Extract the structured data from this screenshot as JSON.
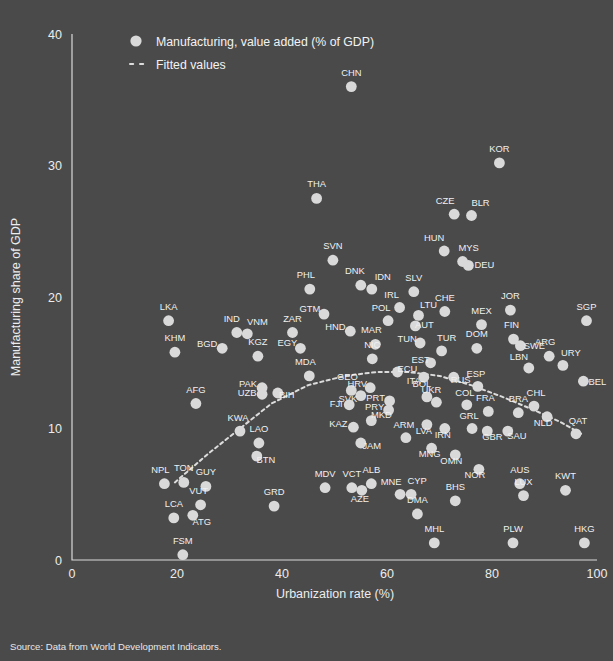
{
  "chart_data": {
    "type": "scatter",
    "title": "",
    "xlabel": "Urbanization rate (%)",
    "ylabel": "Manufacturing share of GDP",
    "xlim": [
      0,
      100
    ],
    "ylim": [
      0,
      40
    ],
    "xticks": [
      0,
      20,
      40,
      60,
      80,
      100
    ],
    "yticks": [
      0,
      10,
      20,
      30,
      40
    ],
    "grid": false,
    "legend_position": "top-left",
    "series": [
      {
        "name": "Manufacturing, value added (% of GDP)",
        "marker": "circle",
        "color": "#d9d9d9"
      },
      {
        "name": "Fitted values",
        "marker": "dashed-line",
        "color": "#dcdcdc"
      }
    ],
    "point_label_field": "iso3",
    "points": [
      {
        "iso3": "CHN",
        "x": 53.2,
        "y": 36.0
      },
      {
        "iso3": "KOR",
        "x": 81.4,
        "y": 30.2
      },
      {
        "iso3": "THA",
        "x": 46.6,
        "y": 27.5
      },
      {
        "iso3": "CZE",
        "x": 72.8,
        "y": 26.3
      },
      {
        "iso3": "BLR",
        "x": 76.1,
        "y": 26.2
      },
      {
        "iso3": "HUN",
        "x": 70.9,
        "y": 23.5
      },
      {
        "iso3": "MYS",
        "x": 74.4,
        "y": 22.7
      },
      {
        "iso3": "DEU",
        "x": 75.5,
        "y": 22.4
      },
      {
        "iso3": "SVN",
        "x": 49.7,
        "y": 22.8
      },
      {
        "iso3": "PHL",
        "x": 45.3,
        "y": 20.6
      },
      {
        "iso3": "DNK",
        "x": 55.0,
        "y": 20.9
      },
      {
        "iso3": "IDN",
        "x": 57.1,
        "y": 20.6
      },
      {
        "iso3": "SLV",
        "x": 65.1,
        "y": 20.4
      },
      {
        "iso3": "IRL",
        "x": 62.4,
        "y": 19.2
      },
      {
        "iso3": "JOR",
        "x": 83.5,
        "y": 19.0
      },
      {
        "iso3": "GTM",
        "x": 48.0,
        "y": 18.7
      },
      {
        "iso3": "LTU",
        "x": 66.0,
        "y": 18.6
      },
      {
        "iso3": "CHE",
        "x": 71.0,
        "y": 18.9
      },
      {
        "iso3": "SGP",
        "x": 98.0,
        "y": 18.2
      },
      {
        "iso3": "LKA",
        "x": 18.4,
        "y": 18.2
      },
      {
        "iso3": "POL",
        "x": 60.2,
        "y": 18.2
      },
      {
        "iso3": "AUT",
        "x": 65.4,
        "y": 17.8
      },
      {
        "iso3": "MEX",
        "x": 78.0,
        "y": 17.9
      },
      {
        "iso3": "IND",
        "x": 31.4,
        "y": 17.3
      },
      {
        "iso3": "VNM",
        "x": 33.4,
        "y": 17.2
      },
      {
        "iso3": "HND",
        "x": 53.0,
        "y": 17.4
      },
      {
        "iso3": "ZAR",
        "x": 42.0,
        "y": 17.3
      },
      {
        "iso3": "FIN",
        "x": 84.1,
        "y": 16.8
      },
      {
        "iso3": "TUN",
        "x": 66.3,
        "y": 16.5
      },
      {
        "iso3": "MAR",
        "x": 57.8,
        "y": 16.4
      },
      {
        "iso3": "EGY",
        "x": 43.5,
        "y": 16.1
      },
      {
        "iso3": "SWE",
        "x": 85.4,
        "y": 16.3
      },
      {
        "iso3": "BGD",
        "x": 28.6,
        "y": 16.1
      },
      {
        "iso3": "KHM",
        "x": 19.6,
        "y": 15.8
      },
      {
        "iso3": "KGZ",
        "x": 35.4,
        "y": 15.5
      },
      {
        "iso3": "DOM",
        "x": 77.1,
        "y": 16.1
      },
      {
        "iso3": "TUR",
        "x": 70.4,
        "y": 15.9
      },
      {
        "iso3": "ARG",
        "x": 90.9,
        "y": 15.5
      },
      {
        "iso3": "NIC",
        "x": 57.2,
        "y": 15.3
      },
      {
        "iso3": "EST",
        "x": 68.3,
        "y": 15.0
      },
      {
        "iso3": "URY",
        "x": 93.5,
        "y": 14.8
      },
      {
        "iso3": "LBN",
        "x": 87.0,
        "y": 14.6
      },
      {
        "iso3": "MDA",
        "x": 45.2,
        "y": 14.0
      },
      {
        "iso3": "ECU",
        "x": 62.0,
        "y": 14.3
      },
      {
        "iso3": "ITA",
        "x": 67.0,
        "y": 13.9
      },
      {
        "iso3": "RUS",
        "x": 72.7,
        "y": 13.9
      },
      {
        "iso3": "ESP",
        "x": 77.3,
        "y": 13.2
      },
      {
        "iso3": "BEL",
        "x": 97.4,
        "y": 13.6
      },
      {
        "iso3": "PAK",
        "x": 36.2,
        "y": 13.1
      },
      {
        "iso3": "UZB",
        "x": 36.2,
        "y": 12.6
      },
      {
        "iso3": "BIH",
        "x": 39.2,
        "y": 12.7
      },
      {
        "iso3": "GEO",
        "x": 53.2,
        "y": 12.9
      },
      {
        "iso3": "HRV",
        "x": 56.8,
        "y": 13.1
      },
      {
        "iso3": "SVK",
        "x": 55.0,
        "y": 12.5
      },
      {
        "iso3": "BOL",
        "x": 67.6,
        "y": 12.4
      },
      {
        "iso3": "UKR",
        "x": 69.4,
        "y": 12.0
      },
      {
        "iso3": "PRT",
        "x": 60.5,
        "y": 12.1
      },
      {
        "iso3": "CHL",
        "x": 88.0,
        "y": 11.7
      },
      {
        "iso3": "AFG",
        "x": 23.6,
        "y": 11.9
      },
      {
        "iso3": "FJI",
        "x": 52.8,
        "y": 11.8
      },
      {
        "iso3": "COL",
        "x": 75.2,
        "y": 11.8
      },
      {
        "iso3": "PRY",
        "x": 60.3,
        "y": 11.4
      },
      {
        "iso3": "FRA",
        "x": 79.3,
        "y": 11.3
      },
      {
        "iso3": "BRA",
        "x": 85.0,
        "y": 11.2
      },
      {
        "iso3": "NLD",
        "x": 90.5,
        "y": 10.9
      },
      {
        "iso3": "MKD",
        "x": 57.0,
        "y": 10.6
      },
      {
        "iso3": "KAZ",
        "x": 53.6,
        "y": 10.1
      },
      {
        "iso3": "LVA",
        "x": 67.6,
        "y": 10.3
      },
      {
        "iso3": "IRN",
        "x": 71.0,
        "y": 10.0
      },
      {
        "iso3": "GRL",
        "x": 76.2,
        "y": 10.0
      },
      {
        "iso3": "GBR",
        "x": 79.1,
        "y": 9.8
      },
      {
        "iso3": "SAU",
        "x": 83.0,
        "y": 9.8
      },
      {
        "iso3": "QAT",
        "x": 96.0,
        "y": 9.6
      },
      {
        "iso3": "KWA",
        "x": 32.0,
        "y": 9.8
      },
      {
        "iso3": "ARM",
        "x": 63.6,
        "y": 9.3
      },
      {
        "iso3": "LAO",
        "x": 35.6,
        "y": 8.9
      },
      {
        "iso3": "JAM",
        "x": 55.0,
        "y": 8.9
      },
      {
        "iso3": "MNG",
        "x": 68.5,
        "y": 8.5
      },
      {
        "iso3": "BTN",
        "x": 35.2,
        "y": 7.9
      },
      {
        "iso3": "OMN",
        "x": 73.0,
        "y": 8.0
      },
      {
        "iso3": "NOR",
        "x": 77.5,
        "y": 6.9
      },
      {
        "iso3": "NPL",
        "x": 17.6,
        "y": 5.8
      },
      {
        "iso3": "TON",
        "x": 21.3,
        "y": 5.9
      },
      {
        "iso3": "GUY",
        "x": 25.5,
        "y": 5.6
      },
      {
        "iso3": "MDV",
        "x": 48.2,
        "y": 5.5
      },
      {
        "iso3": "VCT",
        "x": 53.3,
        "y": 5.5
      },
      {
        "iso3": "ALB",
        "x": 57.0,
        "y": 5.8
      },
      {
        "iso3": "AZE",
        "x": 55.2,
        "y": 5.3
      },
      {
        "iso3": "AUS",
        "x": 85.3,
        "y": 5.8
      },
      {
        "iso3": "KWT",
        "x": 94.0,
        "y": 5.3
      },
      {
        "iso3": "LUX",
        "x": 86.0,
        "y": 4.9
      },
      {
        "iso3": "MNE",
        "x": 62.5,
        "y": 5.0
      },
      {
        "iso3": "CYP",
        "x": 64.6,
        "y": 5.0
      },
      {
        "iso3": "BHS",
        "x": 73.0,
        "y": 4.5
      },
      {
        "iso3": "VUT",
        "x": 24.5,
        "y": 4.2
      },
      {
        "iso3": "GRD",
        "x": 38.5,
        "y": 4.1
      },
      {
        "iso3": "ATG",
        "x": 23.0,
        "y": 3.4
      },
      {
        "iso3": "LCA",
        "x": 19.4,
        "y": 3.2
      },
      {
        "iso3": "DMA",
        "x": 65.8,
        "y": 3.5
      },
      {
        "iso3": "MHL",
        "x": 69.0,
        "y": 1.3
      },
      {
        "iso3": "PLW",
        "x": 84.0,
        "y": 1.3
      },
      {
        "iso3": "HKG",
        "x": 97.6,
        "y": 1.3
      },
      {
        "iso3": "FSM",
        "x": 21.1,
        "y": 0.4
      }
    ],
    "fitted_values": [
      {
        "x": 19.6,
        "y": 5.9
      },
      {
        "x": 26.0,
        "y": 8.1
      },
      {
        "x": 32.0,
        "y": 10.0
      },
      {
        "x": 38.0,
        "y": 11.9
      },
      {
        "x": 45.0,
        "y": 13.3
      },
      {
        "x": 52.0,
        "y": 14.0
      },
      {
        "x": 58.0,
        "y": 14.3
      },
      {
        "x": 64.0,
        "y": 14.3
      },
      {
        "x": 70.0,
        "y": 14.0
      },
      {
        "x": 76.0,
        "y": 13.3
      },
      {
        "x": 82.0,
        "y": 12.4
      },
      {
        "x": 88.0,
        "y": 11.4
      },
      {
        "x": 93.0,
        "y": 10.5
      },
      {
        "x": 97.0,
        "y": 9.6
      }
    ]
  },
  "legend": {
    "items": [
      {
        "label": "Manufacturing, value added (% of GDP)",
        "marker": "circle"
      },
      {
        "label": "Fitted values",
        "marker": "dashed"
      }
    ]
  },
  "axes": {
    "x_title": "Urbanization rate (%)",
    "y_title": "Manufacturing share of GDP",
    "x_ticks": [
      "0",
      "20",
      "40",
      "60",
      "80",
      "100"
    ],
    "y_ticks": [
      "0",
      "10",
      "20",
      "30",
      "40"
    ]
  },
  "footer": {
    "source": "Source: Data from World Development Indicators."
  },
  "colors": {
    "background": "#4a4a4a",
    "marker": "#d9d9d9",
    "axis": "#d9d9d9",
    "text": "#ededed"
  }
}
